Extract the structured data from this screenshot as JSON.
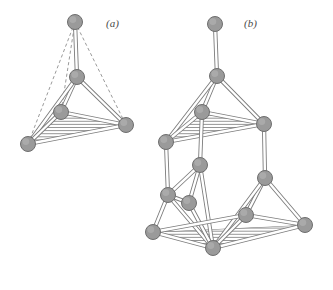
{
  "figure": {
    "background_color": "#ffffff",
    "width": 333,
    "height": 290,
    "node_color": "#9a9a9a",
    "node_stroke": "#6e6e6e",
    "node_highlight": "#b8b8b8",
    "bond_color": "#7d7d7d",
    "bond_fill": "#ffffff",
    "hatch_color": "#8a8a8a",
    "dashed_color": "#9a9a9a",
    "node_radius": 7.5
  },
  "panels": [
    {
      "id": "a",
      "label": "(a)",
      "label_x": 106,
      "label_y": 27,
      "description": "single tetrahedron with apex atom, dashed hidden edges and hatched base face",
      "nodes": [
        {
          "name": "apex",
          "x": 75,
          "y": 22
        },
        {
          "name": "center",
          "x": 77,
          "y": 77
        },
        {
          "name": "base-back",
          "x": 61,
          "y": 112
        },
        {
          "name": "base-right",
          "x": 126,
          "y": 125
        },
        {
          "name": "base-left",
          "x": 28,
          "y": 144
        }
      ],
      "solid_bonds": [
        [
          "apex",
          "center"
        ],
        [
          "center",
          "base-back"
        ],
        [
          "center",
          "base-right"
        ],
        [
          "center",
          "base-left"
        ],
        [
          "base-back",
          "base-right"
        ],
        [
          "base-back",
          "base-left"
        ],
        [
          "base-left",
          "base-right"
        ]
      ],
      "dashed_bonds": [
        [
          "apex",
          "base-back"
        ],
        [
          "apex",
          "base-right"
        ],
        [
          "apex",
          "base-left"
        ]
      ],
      "hatched_faces": [
        [
          "base-back",
          "base-right",
          "base-left"
        ]
      ]
    },
    {
      "id": "b",
      "label": "(b)",
      "label_x": 244,
      "label_y": 27,
      "description": "stacked double tetrahedron framework with terminal apex atom and two hatched faces",
      "nodes": [
        {
          "name": "top-apex",
          "x": 215,
          "y": 24
        },
        {
          "name": "upper-center",
          "x": 217,
          "y": 76
        },
        {
          "name": "upper-back",
          "x": 202,
          "y": 112
        },
        {
          "name": "upper-right",
          "x": 264,
          "y": 124
        },
        {
          "name": "upper-left",
          "x": 166,
          "y": 142
        },
        {
          "name": "mid-center",
          "x": 200,
          "y": 165
        },
        {
          "name": "mid-right",
          "x": 265,
          "y": 178
        },
        {
          "name": "mid-left",
          "x": 168,
          "y": 195
        },
        {
          "name": "mid-front",
          "x": 189,
          "y": 203
        },
        {
          "name": "low-mid",
          "x": 246,
          "y": 215
        },
        {
          "name": "low-right",
          "x": 305,
          "y": 225
        },
        {
          "name": "low-left",
          "x": 153,
          "y": 232
        },
        {
          "name": "low-front",
          "x": 213,
          "y": 248
        }
      ],
      "solid_bonds": [
        [
          "top-apex",
          "upper-center"
        ],
        [
          "upper-center",
          "upper-back"
        ],
        [
          "upper-center",
          "upper-right"
        ],
        [
          "upper-center",
          "upper-left"
        ],
        [
          "upper-back",
          "upper-right"
        ],
        [
          "upper-back",
          "upper-left"
        ],
        [
          "upper-left",
          "upper-right"
        ],
        [
          "upper-back",
          "mid-center"
        ],
        [
          "upper-left",
          "mid-left"
        ],
        [
          "upper-right",
          "mid-right"
        ],
        [
          "mid-center",
          "mid-left"
        ],
        [
          "mid-center",
          "mid-front"
        ],
        [
          "mid-center",
          "low-front"
        ],
        [
          "mid-right",
          "low-mid"
        ],
        [
          "mid-right",
          "low-right"
        ],
        [
          "mid-right",
          "low-front"
        ],
        [
          "mid-left",
          "mid-front"
        ],
        [
          "mid-left",
          "low-left"
        ],
        [
          "mid-left",
          "low-front"
        ],
        [
          "mid-front",
          "low-front"
        ],
        [
          "low-left",
          "low-front"
        ],
        [
          "low-front",
          "low-mid"
        ],
        [
          "low-mid",
          "low-right"
        ],
        [
          "low-left",
          "low-mid"
        ],
        [
          "low-front",
          "low-right"
        ]
      ],
      "dashed_bonds": [],
      "hatched_faces": [
        [
          "upper-back",
          "upper-right",
          "upper-left"
        ],
        [
          "low-left",
          "low-right",
          "low-front"
        ]
      ]
    }
  ]
}
